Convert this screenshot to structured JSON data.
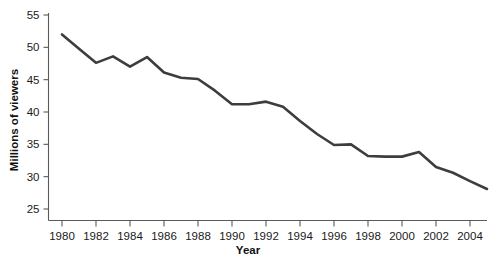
{
  "chart_data": {
    "type": "line",
    "title": "",
    "xlabel": "Year",
    "ylabel": "Millions of viewers",
    "xlim": [
      1980,
      2005
    ],
    "ylim": [
      23,
      55
    ],
    "grid": false,
    "legend": "none",
    "line_color": "#3d3d3d",
    "axis_color": "#5a5a5a",
    "x_ticks": [
      1980,
      1982,
      1984,
      1986,
      1988,
      1990,
      1992,
      1994,
      1996,
      1998,
      2000,
      2002,
      2004
    ],
    "x_tick_labels": [
      "1980",
      "1982",
      "1984",
      "1986",
      "1988",
      "1990",
      "1992",
      "1994",
      "1996",
      "1998",
      "2000",
      "2002",
      "2004"
    ],
    "y_ticks": [
      25,
      30,
      35,
      40,
      45,
      50,
      55
    ],
    "y_tick_labels": [
      "25",
      "30",
      "35",
      "40",
      "45",
      "50",
      "55"
    ],
    "x": [
      1980,
      1981,
      1982,
      1983,
      1984,
      1985,
      1986,
      1987,
      1988,
      1989,
      1990,
      1991,
      1992,
      1993,
      1994,
      1995,
      1996,
      1997,
      1998,
      1999,
      2000,
      2001,
      2002,
      2003,
      2004,
      2005
    ],
    "values": [
      52.0,
      49.8,
      47.6,
      48.6,
      47.0,
      48.5,
      46.1,
      45.3,
      45.1,
      43.3,
      41.2,
      41.2,
      41.6,
      40.8,
      38.6,
      36.6,
      34.9,
      35.0,
      33.2,
      33.1,
      33.1,
      33.8,
      31.5,
      30.6,
      29.3,
      28.1
    ]
  }
}
